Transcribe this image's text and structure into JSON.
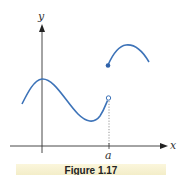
{
  "figure": {
    "axes": {
      "x_label": "x",
      "y_label": "y",
      "tick_label": "a"
    },
    "caption": "Figure 1.17",
    "colors": {
      "curve": "#3d73b8",
      "axis": "#333333",
      "caption_band": "#f6f0d0"
    },
    "curve": {
      "left_piece": {
        "ends_at": "a",
        "endpoint": "open circle"
      },
      "right_piece": {
        "starts_at": "a",
        "endpoint": "filled dot"
      },
      "description": "piecewise function with jump discontinuity at x = a"
    }
  }
}
